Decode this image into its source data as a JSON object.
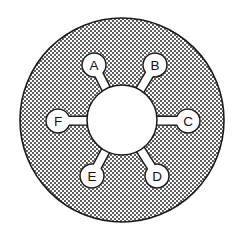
{
  "figure": {
    "background_color": "#ffffff",
    "outline_color": "#1a1a1a",
    "stipple_color": "#1a1a1a",
    "fill_color": "#ffffff"
  },
  "disc": {
    "center_x": 122,
    "center_y": 120,
    "outer_radius": 102,
    "hub_radius": 35,
    "fill_pattern": "stipple-dots",
    "stroke_width": 1.6
  },
  "nodes": [
    {
      "label": "A",
      "cx": 94,
      "cy": 65,
      "r": 12,
      "angle_deg": 243
    },
    {
      "label": "B",
      "cx": 155,
      "cy": 65,
      "r": 12,
      "angle_deg": 297
    },
    {
      "label": "C",
      "cx": 188,
      "cy": 121,
      "r": 12,
      "angle_deg": 359
    },
    {
      "label": "D",
      "cx": 157,
      "cy": 176,
      "r": 12,
      "angle_deg": 59
    },
    {
      "label": "E",
      "cx": 92,
      "cy": 176,
      "r": 12,
      "angle_deg": 121
    },
    {
      "label": "F",
      "cx": 58,
      "cy": 121,
      "r": 12,
      "angle_deg": 181
    }
  ],
  "stem": {
    "half_width": 4.5,
    "description": "straight connector from hub rim to node circle"
  },
  "labels_order": [
    "A",
    "B",
    "C",
    "D",
    "E",
    "F"
  ]
}
